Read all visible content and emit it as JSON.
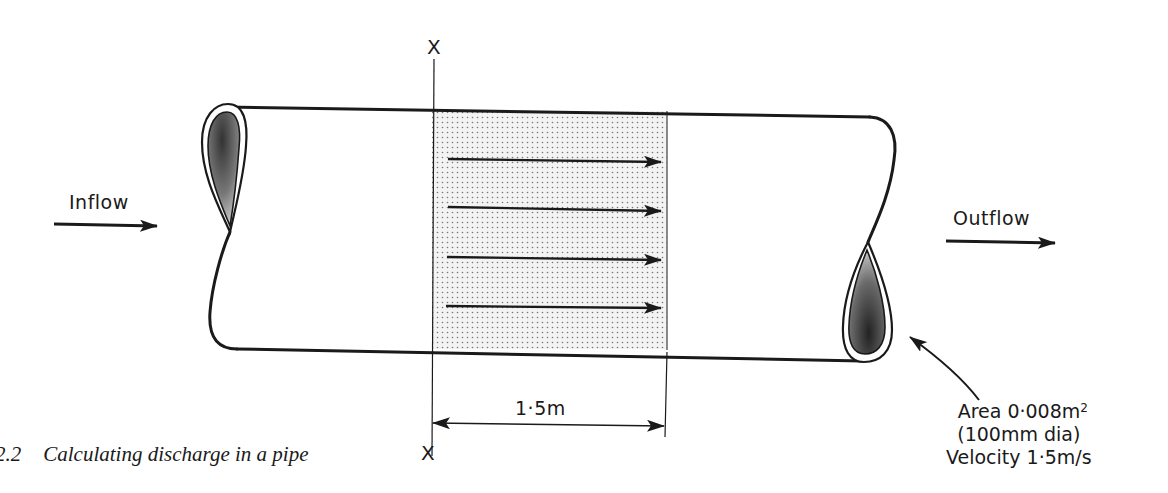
{
  "figure": {
    "caption_number": "2.2",
    "caption_text": "Calculating discharge in a pipe"
  },
  "labels": {
    "inflow": "Inflow",
    "outflow": "Outflow",
    "section_top": "X",
    "section_bottom": "X",
    "dimension": "1·5m",
    "area_line": "Area 0·008m",
    "area_exponent": "2",
    "diameter_line": "(100mm dia)",
    "velocity_line": "Velocity 1·5m/s"
  },
  "colors": {
    "line": "#1a1a1a",
    "stipple_bg": "#f1f1f1",
    "stipple_dot": "#7a7a7a"
  },
  "flow_arrows": [
    {
      "y": 160
    },
    {
      "y": 208
    },
    {
      "y": 258
    },
    {
      "y": 306
    }
  ]
}
